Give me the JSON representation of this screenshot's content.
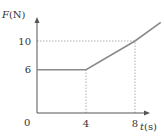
{
  "chart_data": {
    "type": "line",
    "title": "",
    "xlabel_var": "t",
    "xlabel_unit": "(s)",
    "ylabel_var": "F",
    "ylabel_unit": "(N)",
    "origin_label": "0",
    "x_ticks": [
      {
        "value": 4,
        "label": "4"
      },
      {
        "value": 8,
        "label": "8"
      }
    ],
    "y_ticks": [
      {
        "value": 6,
        "label": "6"
      },
      {
        "value": 10,
        "label": "10"
      }
    ],
    "xlim": [
      0,
      11
    ],
    "ylim": [
      0,
      12.5
    ],
    "grid": false,
    "series": [
      {
        "name": "F(t)",
        "points": [
          [
            0,
            6
          ],
          [
            4,
            6
          ],
          [
            8,
            10
          ],
          [
            10.1,
            12.6
          ]
        ]
      }
    ],
    "guides": [
      {
        "type": "vertical",
        "x": 4,
        "from_y": 0,
        "to_y": 6
      },
      {
        "type": "vertical",
        "x": 8,
        "from_y": 0,
        "to_y": 10
      },
      {
        "type": "horizontal",
        "y": 10,
        "from_x": 0,
        "to_x": 8
      }
    ],
    "colors": {
      "line": "#8a8a8a",
      "axis": "#555555",
      "guide": "#9a9a9a"
    }
  }
}
